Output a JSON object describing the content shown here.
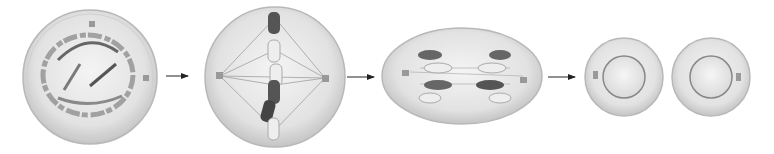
{
  "diagram": {
    "type": "process-sequence",
    "stages": [
      {
        "id": "stage-1",
        "name": "prophase",
        "shape": "circle"
      },
      {
        "id": "stage-2",
        "name": "metaphase",
        "shape": "circle"
      },
      {
        "id": "stage-3",
        "name": "anaphase",
        "shape": "ellipse"
      },
      {
        "id": "stage-4",
        "name": "daughter-cells",
        "shape": "two-circles"
      }
    ],
    "arrows": 3,
    "colors": {
      "background": "#ffffff",
      "cell_fill": "#e4e4e4",
      "cell_edge": "#b8b8b8",
      "chromosome_dark": "#555555",
      "chromosome_light": "#e8e8e8",
      "spindle": "#9a9a9a",
      "arrow": "#222222"
    }
  }
}
